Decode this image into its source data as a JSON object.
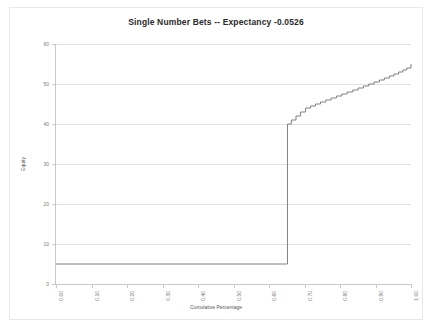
{
  "chart_data": {
    "type": "line",
    "title": "Single Number Bets -- Expectancy -0.0526",
    "subtitle": "",
    "xlabel": "Cumulative Percentage",
    "ylabel": "Equity",
    "xlim": [
      0.0,
      1.0
    ],
    "ylim": [
      0,
      60
    ],
    "xticks": [
      0.0,
      0.1,
      0.2,
      0.3,
      0.4,
      0.5,
      0.6,
      0.7,
      0.8,
      0.9,
      1.0
    ],
    "xtick_labels": [
      "0.00",
      "0.10",
      "0.20",
      "0.30",
      "0.40",
      "0.50",
      "0.60",
      "0.70",
      "0.80",
      "0.90",
      "1.00"
    ],
    "yticks": [
      0,
      10,
      20,
      30,
      40,
      50,
      60
    ],
    "ytick_labels": [
      "0",
      "10",
      "20",
      "30",
      "40",
      "50",
      "60"
    ],
    "grid": "horizontal",
    "legend": "none",
    "line_color": "#808080",
    "line_width": 1,
    "step_style": "post",
    "series": [
      {
        "name": "Equity",
        "x": [
          0.0,
          0.652,
          0.652,
          0.663,
          0.676,
          0.689,
          0.703,
          0.717,
          0.731,
          0.745,
          0.76,
          0.775,
          0.79,
          0.805,
          0.82,
          0.836,
          0.851,
          0.866,
          0.881,
          0.896,
          0.911,
          0.925,
          0.939,
          0.952,
          0.965,
          0.977,
          0.988,
          1.0
        ],
        "values": [
          5.0,
          5.0,
          40.0,
          41.0,
          42.0,
          43.0,
          44.0,
          44.5,
          45.0,
          45.5,
          46.0,
          46.5,
          47.0,
          47.5,
          48.0,
          48.5,
          49.0,
          49.5,
          50.0,
          50.5,
          51.0,
          51.5,
          52.0,
          52.5,
          53.0,
          53.5,
          54.0,
          55.0
        ]
      }
    ],
    "annotations": [
      {
        "text": "flat equity near 5 until cumulative percentage 0.65",
        "type": "description"
      },
      {
        "text": "vertical jump from 5 to 40 at cumulative percentage 0.65",
        "type": "description"
      },
      {
        "text": "monotonic staircase rising from 40 to 55 across remaining range",
        "type": "description"
      }
    ]
  }
}
